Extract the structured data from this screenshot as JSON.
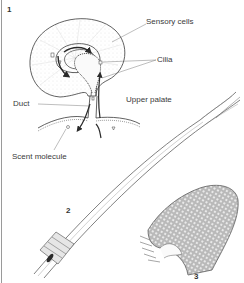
{
  "figure": {
    "panels": [
      {
        "number": "1",
        "subject": "vomeronasal organ cross-section"
      },
      {
        "number": "2",
        "subject": "forked tongue"
      },
      {
        "number": "3",
        "subject": "tongue tip surface"
      }
    ],
    "labels": {
      "sensory_cells": "Sensory cells",
      "cilia": "Cilia",
      "duct": "Duct",
      "upper_palate": "Upper palate",
      "scent_molecule": "Scent molecule"
    },
    "panel_numbers": {
      "p1": "1",
      "p2": "2",
      "p3": "3"
    },
    "colors": {
      "ink": "#3a3a3a",
      "stipple": "#cfcfcf",
      "arrow": "#2a2a2a",
      "border": "#9a9a9a",
      "background": "#ffffff"
    }
  }
}
